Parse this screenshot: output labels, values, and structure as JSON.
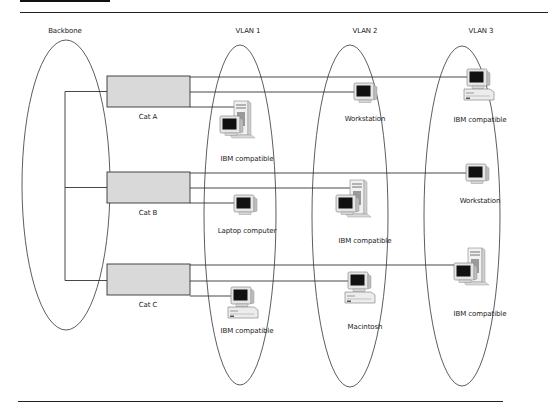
{
  "diagram": {
    "groups": {
      "backbone": "Backbone",
      "vlan1": "VLAN 1",
      "vlan2": "VLAN 2",
      "vlan3": "VLAN 3"
    },
    "switches": [
      {
        "label": "Cat A"
      },
      {
        "label": "Cat B"
      },
      {
        "label": "Cat C"
      }
    ],
    "devices": {
      "catA_vlan1": "IBM compatible",
      "catA_vlan2": "Workstation",
      "catA_vlan3": "IBM compatible",
      "catB_vlan1": "Laptop computer",
      "catB_vlan2": "IBM compatible",
      "catB_vlan3": "Workstation",
      "catC_vlan1": "IBM compatible",
      "catC_vlan2": "Macintosh",
      "catC_vlan3": "IBM compatible"
    },
    "colors": {
      "line": "#333333",
      "switch_fill": "#d9d9d9",
      "screen": "#111111",
      "case": "#e8e8e8"
    }
  }
}
